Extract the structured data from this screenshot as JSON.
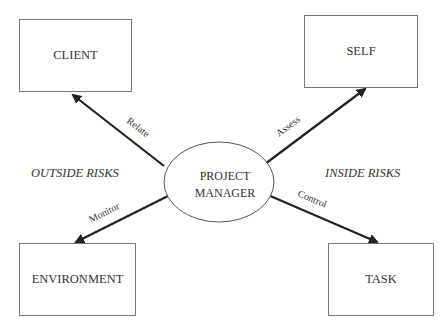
{
  "diagram": {
    "center": {
      "label_line1": "PROJECT",
      "label_line2": "MANAGER"
    },
    "nodes": {
      "client": "CLIENT",
      "self": "SELF",
      "environment": "ENVIRONMENT",
      "task": "TASK"
    },
    "edges": {
      "relate": "Relate",
      "assess": "Assess",
      "monitor": "Monitor",
      "control": "Control"
    },
    "regions": {
      "outside": "OUTSIDE RISKS",
      "inside": "INSIDE RISKS"
    },
    "colors": {
      "line": "#222222",
      "border": "#777777",
      "text": "#333333"
    }
  }
}
